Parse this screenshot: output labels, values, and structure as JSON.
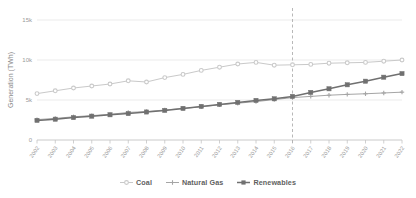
{
  "chart_data": {
    "type": "line",
    "title": "",
    "subtitle": "",
    "xlabel": "",
    "ylabel": "Generation (TWh)",
    "x": [
      2002,
      2003,
      2004,
      2005,
      2006,
      2007,
      2008,
      2009,
      2010,
      2011,
      2012,
      2013,
      2014,
      2015,
      2016,
      2017,
      2018,
      2019,
      2020,
      2021,
      2022
    ],
    "categories": [
      "2002",
      "2003",
      "2004",
      "2005",
      "2006",
      "2007",
      "2008",
      "2009",
      "2010",
      "2011",
      "2012",
      "2013",
      "2014",
      "2015",
      "2016",
      "2017",
      "2018",
      "2019",
      "2020",
      "2021",
      "2022"
    ],
    "series": [
      {
        "name": "Coal",
        "color": "#c9c9c9",
        "marker": "circle",
        "values": [
          5800,
          6150,
          6500,
          6750,
          7000,
          7400,
          7250,
          7800,
          8200,
          8700,
          9100,
          9500,
          9700,
          9350,
          9400,
          9450,
          9600,
          9650,
          9700,
          9850,
          10000
        ]
      },
      {
        "name": "Natural Gas",
        "color": "#a5a5a5",
        "marker": "plus",
        "values": [
          2550,
          2700,
          2900,
          3050,
          3200,
          3450,
          3550,
          3750,
          3950,
          4150,
          4400,
          4600,
          4800,
          5050,
          5300,
          5450,
          5600,
          5700,
          5780,
          5880,
          5980
        ]
      },
      {
        "name": "Renewables",
        "color": "#707070",
        "marker": "square",
        "values": [
          2450,
          2600,
          2800,
          2980,
          3150,
          3300,
          3500,
          3700,
          3950,
          4200,
          4450,
          4700,
          4950,
          5150,
          5450,
          5950,
          6400,
          6900,
          7350,
          7850,
          8300
        ]
      }
    ],
    "ylim": [
      0,
      15000
    ],
    "yticks": [
      0,
      5000,
      10000,
      15000
    ],
    "ytick_labels": [
      "0",
      "5k",
      "10k",
      "15k"
    ],
    "xlim": [
      2002,
      2022
    ],
    "grid": true,
    "grid_axis": "y",
    "legend_position": "bottom",
    "annotations": [
      {
        "type": "vline",
        "x": 2016,
        "style": "dashed",
        "color": "#b0b0b0",
        "label": ""
      }
    ]
  },
  "legend": {
    "items": [
      {
        "label": "Coal"
      },
      {
        "label": "Natural Gas"
      },
      {
        "label": "Renewables"
      }
    ]
  },
  "axes": {
    "y_title": "Generation (TWh)"
  }
}
